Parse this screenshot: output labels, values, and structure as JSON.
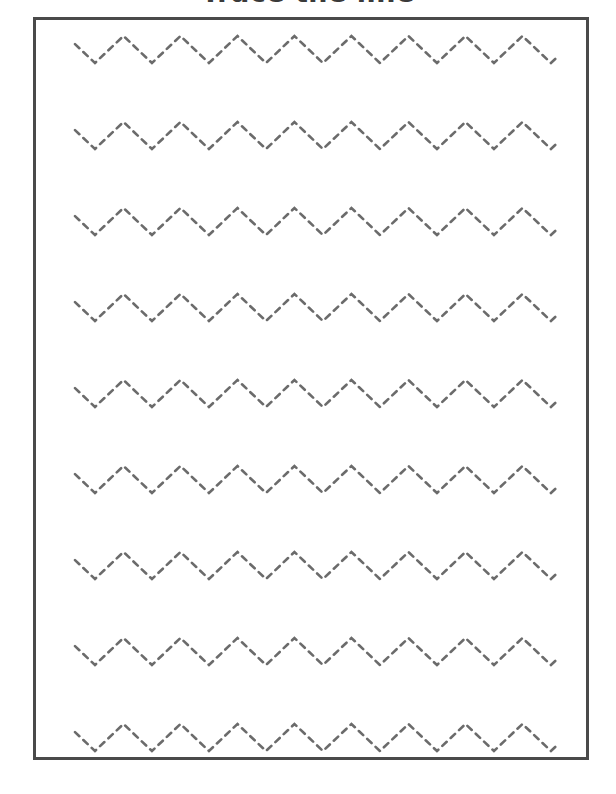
{
  "page": {
    "width": 616,
    "height": 794,
    "background_color": "#ffffff"
  },
  "title": {
    "text": "Trace the line",
    "color": "#3a3a3a",
    "clipped_at_top": true
  },
  "frame": {
    "border_color": "#4a4a4a",
    "border_width_px": 3,
    "left": 33,
    "top": 17,
    "width": 556,
    "height": 743
  },
  "tracing": {
    "stroke_color": "#6b6b6b",
    "stroke_width_px": 2.6,
    "dash_pattern": "6 5.5",
    "pattern_name": "zigzag",
    "row_count": 9,
    "wavelength_px": 57,
    "amplitude_px": 27,
    "row_pitch_px": 86,
    "line_start_x": 39,
    "line_end_x": 522,
    "rows": [
      {
        "index": 1,
        "label": "zigzag-row-1",
        "top": 0,
        "peak_y": 16,
        "valley_y": 43
      },
      {
        "index": 2,
        "label": "zigzag-row-2",
        "top": 86,
        "peak_y": 16,
        "valley_y": 43
      },
      {
        "index": 3,
        "label": "zigzag-row-3",
        "top": 172,
        "peak_y": 16,
        "valley_y": 43
      },
      {
        "index": 4,
        "label": "zigzag-row-4",
        "top": 258,
        "peak_y": 16,
        "valley_y": 43
      },
      {
        "index": 5,
        "label": "zigzag-row-5",
        "top": 344,
        "peak_y": 16,
        "valley_y": 43
      },
      {
        "index": 6,
        "label": "zigzag-row-6",
        "top": 430,
        "peak_y": 16,
        "valley_y": 43
      },
      {
        "index": 7,
        "label": "zigzag-row-7",
        "top": 516,
        "peak_y": 16,
        "valley_y": 43
      },
      {
        "index": 8,
        "label": "zigzag-row-8",
        "top": 602,
        "peak_y": 16,
        "valley_y": 43
      },
      {
        "index": 9,
        "label": "zigzag-row-9",
        "top": 688,
        "peak_y": 16,
        "valley_y": 43
      }
    ]
  }
}
